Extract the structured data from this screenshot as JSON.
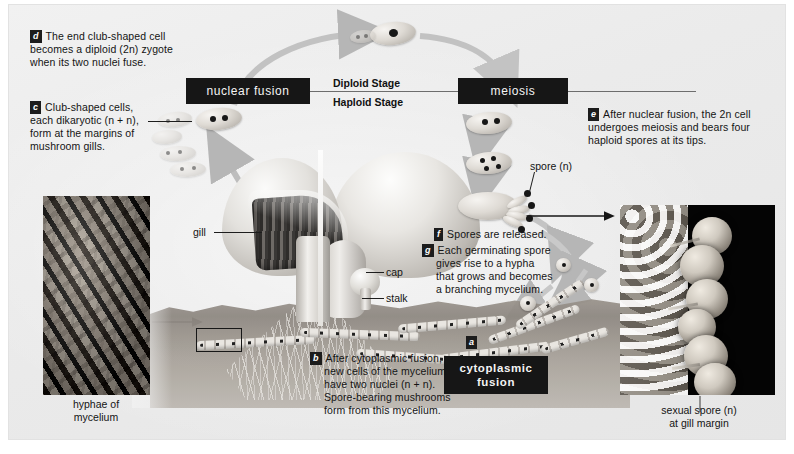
{
  "figure": {
    "stage_labels": {
      "diploid": "Diploid Stage",
      "haploid": "Haploid Stage"
    },
    "process_boxes": {
      "nuclear_fusion": "nuclear fusion",
      "meiosis": "meiosis",
      "cytoplasmic_fusion": "cytoplasmic\nfusion",
      "cytoplasmic_fusion_line1": "cytoplasmic",
      "cytoplasmic_fusion_line2": "fusion"
    },
    "steps": [
      {
        "key": "a",
        "letter": "a",
        "text": "",
        "note": "label marker on hypha at cytoplasmic fusion point"
      },
      {
        "key": "b",
        "letter": "b",
        "lines": [
          "After cytoplasmic fusion,",
          "new cells of the mycelium",
          "have two nuclei (n + n).",
          "Spore-bearing mushrooms",
          "form from this mycelium."
        ]
      },
      {
        "key": "c",
        "letter": "c",
        "lines": [
          "Club-shaped cells,",
          "each dikaryotic (n + n),",
          "form at the margins of",
          "mushroom gills."
        ]
      },
      {
        "key": "d",
        "letter": "d",
        "lines": [
          "The end club-shaped cell",
          "becomes a diploid (2n) zygote",
          "when its two nuclei fuse."
        ]
      },
      {
        "key": "e",
        "letter": "e",
        "lines": [
          "After nuclear fusion, the 2n cell",
          "undergoes meiosis and bears four",
          "haploid spores at its tips."
        ]
      },
      {
        "key": "f",
        "letter": "f",
        "lines": [
          "Spores are released."
        ]
      },
      {
        "key": "g",
        "letter": "g",
        "lines": [
          "Each germinating spore",
          "gives rise to a hypha",
          "that grows and becomes",
          "a branching mycelium."
        ]
      }
    ],
    "callouts": {
      "gill": "gill",
      "cap": "cap",
      "stalk": "stalk",
      "spore": "spore (n)"
    },
    "photo_captions": {
      "left_line1": "hyphae of",
      "left_line2": "mycelium",
      "right_line1": "sexual spore (n)",
      "right_line2": "at gill margin"
    },
    "colors": {
      "panel_background": "#ebebeb",
      "box_fill": "#161616",
      "box_text": "#f4f4f4",
      "body_text": "#141414",
      "leader_line": "#1d1d1d",
      "arrow_gray": "#bdbdbd",
      "photo_dark": "#040404"
    }
  }
}
